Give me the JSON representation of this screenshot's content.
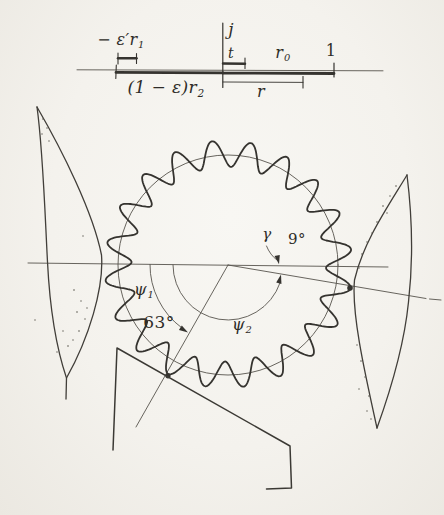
{
  "colors": {
    "paper": "#f4f2ed",
    "ink": "#35332f",
    "thin_line": "#57544d"
  },
  "top_scale": {
    "left_upper": {
      "prefix": "− ε′",
      "base": "r",
      "sub": "1"
    },
    "j": "j",
    "t": "t",
    "r0": {
      "base": "r",
      "sub": "0"
    },
    "one": "1",
    "lower_left": {
      "prefix": "(1 − ε)",
      "base": "r",
      "sub": "2"
    },
    "r": "r"
  },
  "angles": {
    "psi1": {
      "base": "ψ",
      "sub": "1"
    },
    "psi1_value": "63°",
    "psi2": {
      "base": "ψ",
      "sub": "2"
    },
    "gamma": "γ",
    "gamma_value": "9°"
  }
}
